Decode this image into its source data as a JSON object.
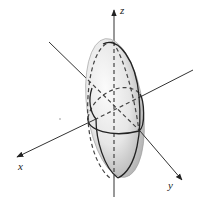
{
  "figure": {
    "axes": {
      "x_label": "x",
      "y_label": "y",
      "z_label": "z"
    },
    "colors": {
      "axis": "#333333",
      "surface_light": "#f4f4f4",
      "surface_dark": "#b8b8b8",
      "trace": "#222222"
    }
  }
}
